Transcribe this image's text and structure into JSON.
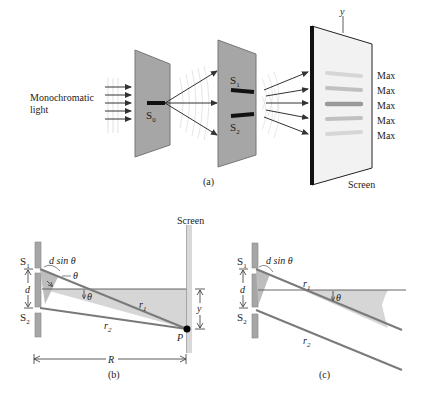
{
  "panel_a": {
    "caption": "(a)",
    "light_label_line1": "Monochromatic",
    "light_label_line2": "light",
    "source_label": "S",
    "source_sub": "0",
    "slit1_label": "S",
    "slit1_sub": "1",
    "slit2_label": "S",
    "slit2_sub": "2",
    "y_axis_label": "y",
    "screen_label": "Screen",
    "maxima": [
      "Max",
      "Max",
      "Max",
      "Max",
      "Max"
    ]
  },
  "panel_b": {
    "caption": "(b)",
    "screen_label": "Screen",
    "s1": "S",
    "s1_sub": "1",
    "s2": "S",
    "s2_sub": "2",
    "path_diff_label": "d sin θ",
    "theta_label": "θ",
    "d_label": "d",
    "r1_label": "r",
    "r1_sub": "1",
    "r2_label": "r",
    "r2_sub": "2",
    "y_label": "y",
    "point_label": "P",
    "distance_label": "R"
  },
  "panel_c": {
    "caption": "(c)",
    "s1": "S",
    "s1_sub": "1",
    "s2": "S",
    "s2_sub": "2",
    "path_diff_label": "d sin θ",
    "theta_label": "θ",
    "d_label": "d",
    "r1_label": "r",
    "r1_sub": "1",
    "r2_label": "r",
    "r2_sub": "2"
  },
  "colors": {
    "barrier": "#9a9a9a",
    "barrier_edge": "#6e6e6e",
    "shade": "#cfcfcf",
    "ray": "#7a7a7a",
    "text": "#222222"
  }
}
